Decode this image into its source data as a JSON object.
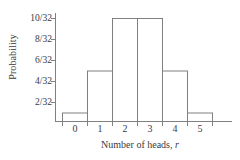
{
  "chart_data": {
    "type": "bar",
    "title": "",
    "xlabel": "Number of heads, r",
    "xlabel_text": "Number of heads,",
    "xlabel_variable": "r",
    "ylabel": "Probability",
    "categories": [
      "0",
      "1",
      "2",
      "3",
      "4",
      "5"
    ],
    "values": [
      1,
      5,
      10,
      10,
      5,
      1
    ],
    "value_labels": [
      "1/32",
      "5/32",
      "10/32",
      "10/32",
      "5/32",
      "1/32"
    ],
    "denominator": 32,
    "ylim": [
      0,
      11
    ],
    "yticks": [
      2,
      4,
      6,
      8,
      10
    ],
    "ytick_labels": [
      "2/32",
      "4/32",
      "6/32",
      "8/32",
      "10/32"
    ],
    "xticks": [
      "0",
      "1",
      "2",
      "3",
      "4",
      "5"
    ],
    "grid": false,
    "legend": false,
    "bar_fill": "#ffffff",
    "bar_stroke": "#808080",
    "axis_color": "#808080",
    "text_color": "#3b3b3b"
  }
}
